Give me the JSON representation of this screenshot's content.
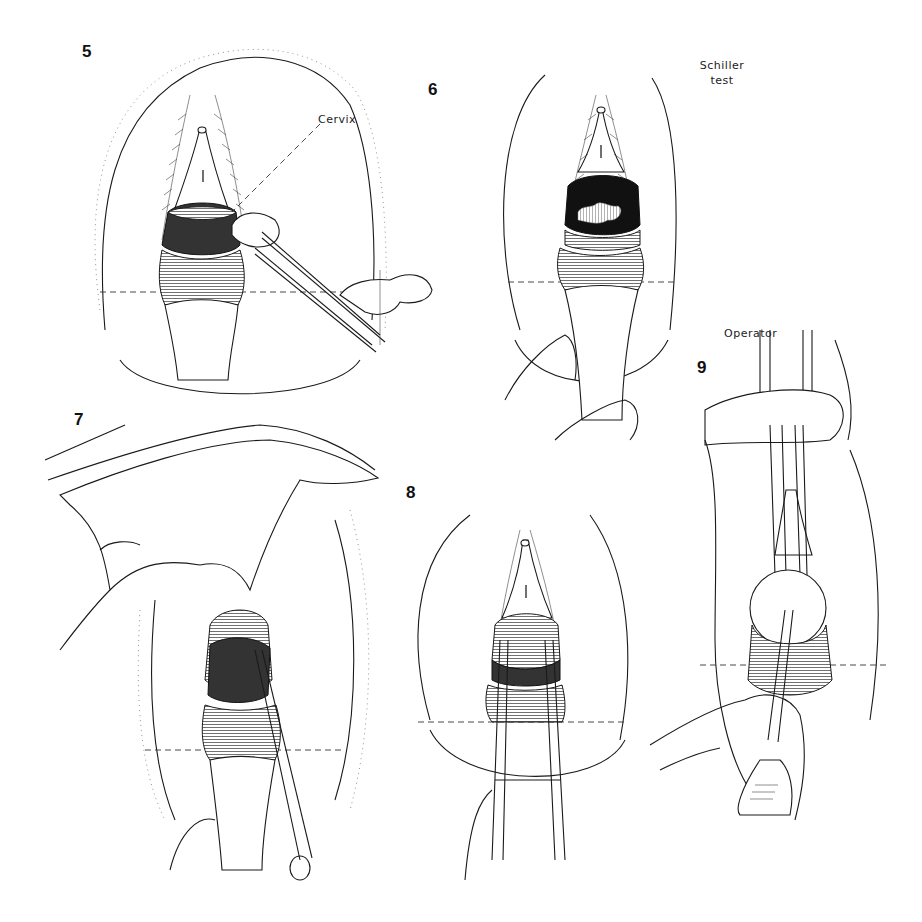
{
  "figure": {
    "panels": [
      {
        "number": "5",
        "annotation": "Cervix",
        "content": "cotton swab held with forceps applied to cervix through speculum"
      },
      {
        "number": "6",
        "annotation": "Schiller test",
        "content": "cervix after iodine staining showing unstained central area"
      },
      {
        "number": "7",
        "annotation": "",
        "content": "hand retracting while forceps grasp cervix"
      },
      {
        "number": "8",
        "annotation": "",
        "content": "tenaculum forceps grasping cervix through speculum"
      },
      {
        "number": "9",
        "annotation": "Operator",
        "content": "operator holding tenaculum; instrument inserted into cervical os"
      }
    ],
    "labels": {
      "p5": "5",
      "p6": "6",
      "p7": "7",
      "p8": "8",
      "p9": "9",
      "cervix": "Cervix",
      "schiller_line1": "Schiller",
      "schiller_line2": "test",
      "operator": "Operator"
    }
  }
}
